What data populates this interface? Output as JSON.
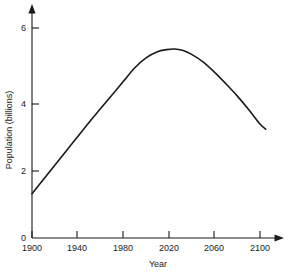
{
  "chart_data": {
    "type": "line",
    "title": "",
    "xlabel": "Year",
    "ylabel": "Population (billions)",
    "xlim": [
      1900,
      2107
    ],
    "ylim": [
      0,
      6.6
    ],
    "grid": false,
    "legend": "none",
    "x_ticks": [
      1900,
      1940,
      1980,
      2020,
      2060,
      2100
    ],
    "x_tick_labels": [
      "1900",
      "1940",
      "1980",
      "2020",
      "2060",
      "2100"
    ],
    "y_ticks": [
      0,
      2,
      4,
      6
    ],
    "y_tick_labels": [
      "0",
      "2",
      "4",
      "6"
    ],
    "series": [
      {
        "name": "Population",
        "x": [
          1900,
          1910,
          1920,
          1930,
          1940,
          1950,
          1960,
          1970,
          1980,
          1990,
          2000,
          2010,
          2018,
          2025,
          2032,
          2040,
          2050,
          2060,
          2070,
          2080,
          2090,
          2100,
          2105
        ],
        "values": [
          1.3,
          1.72,
          2.14,
          2.56,
          2.98,
          3.4,
          3.8,
          4.2,
          4.6,
          5.0,
          5.3,
          5.48,
          5.54,
          5.56,
          5.52,
          5.4,
          5.18,
          4.88,
          4.54,
          4.18,
          3.78,
          3.35,
          3.2
        ]
      }
    ],
    "annotations": {
      "peak_year": 2025,
      "peak_value": 5.56,
      "start_year": 1900,
      "start_value": 1.3,
      "end_year": 2105,
      "end_value": 3.2
    },
    "style": {
      "line_color": "#1a1a1a",
      "axis_color": "#1a1a1a",
      "background": "#ffffff",
      "axis_arrows": true
    }
  }
}
